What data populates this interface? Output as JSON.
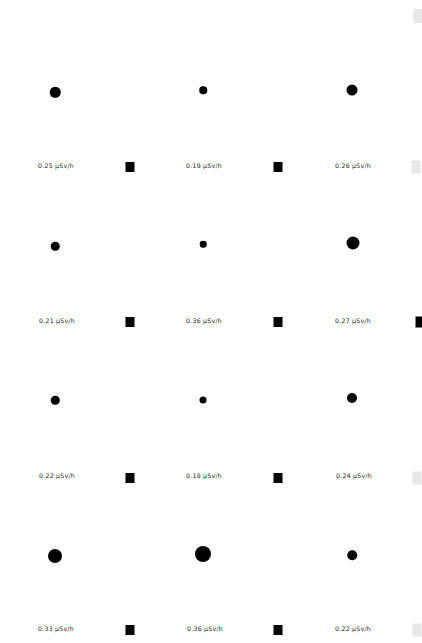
{
  "canvas": {
    "width": 422,
    "height": 643,
    "background": "#ffffff",
    "marker_color": "#000000",
    "faint_marker_color": "#e8e8e8",
    "label_color": "#1a1a1a"
  },
  "units": "µSv/h",
  "chart_data": {
    "type": "scatter",
    "title": "",
    "xlabel": "",
    "ylabel": "",
    "grid": false,
    "legend": null,
    "value_unit": "µSv/h",
    "columns": 4,
    "rows": 4,
    "size_encodes": "value",
    "points": [
      {
        "row": 0,
        "col": 0,
        "value": 0.25,
        "label": "0.25 µSv/h",
        "dot_x": 55,
        "dot_y": 92,
        "dot_d": 10.5,
        "label_x": 56,
        "label_y": 166,
        "sq_x": 130,
        "sq_y": 167,
        "sq_w": 9,
        "sq_h": 10,
        "sq_faint": false
      },
      {
        "row": 0,
        "col": 1,
        "value": 0.19,
        "label": "0.19 µSv/h",
        "dot_x": 203,
        "dot_y": 90,
        "dot_d": 7.5,
        "label_x": 204,
        "label_y": 166,
        "sq_x": 278,
        "sq_y": 167,
        "sq_w": 9,
        "sq_h": 10,
        "sq_faint": false
      },
      {
        "row": 0,
        "col": 2,
        "value": 0.26,
        "label": "0.26 µSv/h",
        "dot_x": 352,
        "dot_y": 90,
        "dot_d": 11,
        "label_x": 353,
        "label_y": 166,
        "sq_x": 416,
        "sq_y": 167,
        "sq_w": 9,
        "sq_h": 13,
        "sq_faint": true
      },
      {
        "row": 1,
        "col": 0,
        "value": 0.21,
        "label": "0.21  µSv/h",
        "dot_x": 55,
        "dot_y": 246,
        "dot_d": 8.5,
        "label_x": 57,
        "label_y": 321,
        "sq_x": 130,
        "sq_y": 322,
        "sq_w": 9,
        "sq_h": 10,
        "sq_faint": false
      },
      {
        "row": 1,
        "col": 1,
        "value": 0.36,
        "label": "0.36 µSv/h",
        "dot_x": 203,
        "dot_y": 244,
        "dot_d": 6.5,
        "label_x": 204,
        "label_y": 321,
        "sq_x": 278,
        "sq_y": 322,
        "sq_w": 9,
        "sq_h": 10,
        "sq_faint": false
      },
      {
        "row": 1,
        "col": 2,
        "value": 0.27,
        "label": "0.27 µSv/h",
        "dot_x": 353,
        "dot_y": 243,
        "dot_d": 13,
        "label_x": 353,
        "label_y": 321,
        "sq_x": 419,
        "sq_y": 322,
        "sq_w": 7,
        "sq_h": 11,
        "sq_faint": false
      },
      {
        "row": 2,
        "col": 0,
        "value": 0.22,
        "label": "0.22  µSv/h",
        "dot_x": 55,
        "dot_y": 400,
        "dot_d": 8.5,
        "label_x": 57,
        "label_y": 476,
        "sq_x": 130,
        "sq_y": 478,
        "sq_w": 9,
        "sq_h": 10,
        "sq_faint": false
      },
      {
        "row": 2,
        "col": 1,
        "value": 0.18,
        "label": "0.18 µSv/h",
        "dot_x": 203,
        "dot_y": 400,
        "dot_d": 7,
        "label_x": 204,
        "label_y": 476,
        "sq_x": 278,
        "sq_y": 478,
        "sq_w": 9,
        "sq_h": 10,
        "sq_faint": false
      },
      {
        "row": 2,
        "col": 2,
        "value": 0.24,
        "label": "0.24  µSv/h",
        "dot_x": 352,
        "dot_y": 398,
        "dot_d": 10,
        "label_x": 354,
        "label_y": 476,
        "sq_x": 417,
        "sq_y": 478,
        "sq_w": 9,
        "sq_h": 13,
        "sq_faint": true
      },
      {
        "row": 3,
        "col": 0,
        "value": 0.33,
        "label": "0.33 µSv/h",
        "dot_x": 55,
        "dot_y": 556,
        "dot_d": 14,
        "label_x": 56,
        "label_y": 629,
        "sq_x": 130,
        "sq_y": 630,
        "sq_w": 9,
        "sq_h": 10,
        "sq_faint": false
      },
      {
        "row": 3,
        "col": 1,
        "value": 0.36,
        "label": "0.36 µSv/h",
        "dot_x": 203,
        "dot_y": 554,
        "dot_d": 16,
        "label_x": 205,
        "label_y": 629,
        "sq_x": 278,
        "sq_y": 630,
        "sq_w": 9,
        "sq_h": 10,
        "sq_faint": false
      },
      {
        "row": 3,
        "col": 2,
        "value": 0.22,
        "label": "0.22 µSv/h",
        "dot_x": 352,
        "dot_y": 555,
        "dot_d": 9.5,
        "label_x": 353,
        "label_y": 629,
        "sq_x": 417,
        "sq_y": 630,
        "sq_w": 9,
        "sq_h": 13,
        "sq_faint": true
      }
    ],
    "edge_markers": [
      {
        "x": 418,
        "y": 16,
        "w": 9,
        "h": 14,
        "faint": true
      }
    ]
  }
}
